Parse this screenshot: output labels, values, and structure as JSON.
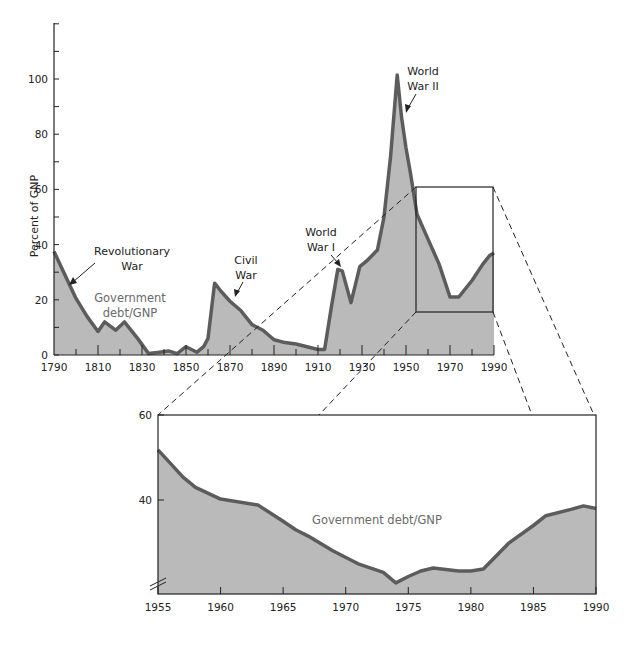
{
  "colors": {
    "fill": "#bababa",
    "line": "#5c5c5c",
    "axis": "#222222",
    "label": "#6a6a6a"
  },
  "chart_data": [
    {
      "type": "area",
      "title": "",
      "xlabel": "",
      "ylabel": "Percent of GNP",
      "xlim": [
        1790,
        1990
      ],
      "ylim": [
        0,
        120
      ],
      "x_ticks": [
        1790,
        1810,
        1830,
        1850,
        1870,
        1890,
        1910,
        1930,
        1950,
        1970,
        1990
      ],
      "y_ticks": [
        0,
        20,
        40,
        60,
        80,
        100
      ],
      "series": [
        {
          "name": "Government debt/GNP",
          "x": [
            1790,
            1795,
            1800,
            1805,
            1810,
            1813,
            1818,
            1822,
            1828,
            1833,
            1838,
            1842,
            1846,
            1850,
            1855,
            1858,
            1860,
            1863,
            1866,
            1870,
            1875,
            1880,
            1885,
            1890,
            1895,
            1900,
            1905,
            1910,
            1913,
            1916,
            1919,
            1921,
            1925,
            1929,
            1932,
            1937,
            1940,
            1943,
            1946,
            1948,
            1950,
            1952,
            1955,
            1960,
            1965,
            1970,
            1974,
            1980,
            1985,
            1988,
            1990
          ],
          "values": [
            37.5,
            29,
            20.5,
            14,
            8.5,
            12,
            9,
            12,
            6,
            0.5,
            1,
            1.5,
            0.5,
            3,
            1,
            3,
            6,
            26,
            23,
            19.5,
            16,
            11,
            9,
            5.5,
            4.5,
            4,
            3,
            2,
            2,
            17,
            31,
            30.5,
            19,
            32,
            34,
            38,
            50,
            72,
            101.5,
            86,
            75,
            66,
            51,
            42,
            33,
            21,
            21,
            27,
            33,
            36,
            37
          ]
        }
      ],
      "annotations": [
        {
          "text": "Revolutionary War",
          "x": 1793,
          "y": 33
        },
        {
          "text": "Civil War",
          "x": 1867,
          "y": 24
        },
        {
          "text": "World War I",
          "x": 1920,
          "y": 30
        },
        {
          "text": "World War II",
          "x": 1947,
          "y": 90
        }
      ],
      "inline_label": "Government debt/GNP",
      "zoom_box": {
        "x": [
          1954,
          1990
        ],
        "y": [
          17,
          61
        ]
      }
    },
    {
      "type": "area",
      "title": "",
      "xlabel": "",
      "ylabel": "",
      "xlim": [
        1955,
        1990
      ],
      "ylim": [
        18,
        60
      ],
      "x_ticks": [
        1955,
        1960,
        1965,
        1970,
        1975,
        1980,
        1985,
        1990
      ],
      "y_ticks": [
        40,
        60
      ],
      "axis_break": true,
      "series": [
        {
          "name": "Government debt/GNP",
          "x": [
            1955,
            1957,
            1958,
            1960,
            1963,
            1965,
            1966,
            1967,
            1969,
            1971,
            1973,
            1974,
            1975,
            1976,
            1977,
            1979,
            1980,
            1981,
            1983,
            1985,
            1986,
            1988,
            1989,
            1990
          ],
          "values": [
            51.8,
            45.4,
            43,
            40.2,
            38.8,
            35,
            33,
            31.5,
            28,
            25,
            23,
            20.5,
            22,
            23.3,
            24,
            23.3,
            23.3,
            23.8,
            29.8,
            34,
            36.3,
            37.8,
            38.6,
            38
          ]
        }
      ],
      "inline_label": "Government debt/GNP"
    }
  ],
  "main": {
    "ylabel": "Percent of GNP",
    "y_tick_labels": [
      "0",
      "20",
      "40",
      "60",
      "80",
      "100"
    ],
    "x_tick_labels": [
      "1790",
      "1810",
      "1830",
      "1850",
      "1870",
      "1890",
      "1910",
      "1930",
      "1950",
      "1970",
      "1990"
    ],
    "annotations": {
      "rev_1": "Revolutionary",
      "rev_2": "War",
      "civil_1": "Civil",
      "civil_2": "War",
      "ww1_1": "World",
      "ww1_2": "War I",
      "ww2_1": "World",
      "ww2_2": "War II"
    },
    "label_1": "Government",
    "label_2": "debt/GNP"
  },
  "inset": {
    "y_tick_labels": [
      "40",
      "60"
    ],
    "x_tick_labels": [
      "1955",
      "1960",
      "1965",
      "1970",
      "1975",
      "1980",
      "1985",
      "1990"
    ],
    "label": "Government debt/GNP"
  }
}
